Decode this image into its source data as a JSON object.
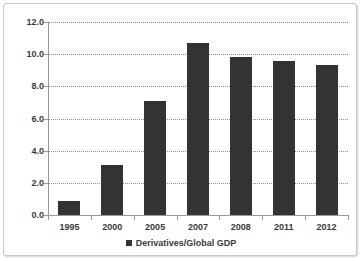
{
  "chart_data": {
    "type": "bar",
    "title": "",
    "subtitle": "",
    "xlabel": "",
    "ylabel": "",
    "categories": [
      "1995",
      "2000",
      "2005",
      "2007",
      "2008",
      "2011",
      "2012"
    ],
    "series": [
      {
        "name": "Derivatives/Global GDP",
        "values": [
          0.9,
          3.1,
          7.1,
          10.7,
          9.8,
          9.6,
          9.3
        ],
        "color": "#333333"
      }
    ],
    "values": [
      0.9,
      3.1,
      7.1,
      10.7,
      9.8,
      9.6,
      9.3
    ],
    "ylim": [
      0.0,
      12.0
    ],
    "ytick_step": 2.0,
    "ytick_labels": [
      "12.0",
      "10.0",
      "8.0",
      "6.0",
      "4.0",
      "2.0",
      "0.0"
    ],
    "ytick_values": [
      12.0,
      10.0,
      8.0,
      6.0,
      4.0,
      2.0,
      0.0
    ],
    "grid": {
      "horizontal": true,
      "vertical": false,
      "style": "dotted",
      "color": "#8f8f8f"
    },
    "legend": {
      "position": "bottom",
      "entries": [
        {
          "label": "Derivatives/Global GDP",
          "color": "#333333",
          "marker": "square"
        }
      ]
    },
    "axis_color": "#9a9a9a",
    "plot_background": "#ffffff",
    "frame_border_color": "#c8c8c8"
  }
}
